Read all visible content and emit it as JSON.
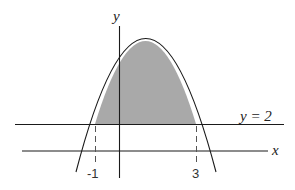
{
  "diagram": {
    "type": "area between curves",
    "curve": "downward parabola",
    "line_label": "y = 2",
    "x_axis_label": "x",
    "y_axis_label": "y",
    "tick_labels": [
      "-1",
      "3"
    ],
    "shaded_region": "between parabola and y = 2 from x = -1 to x = 3",
    "colors": {
      "shade": "#a9a9a9",
      "stroke": "#1a1a1a",
      "background": "#ffffff"
    }
  }
}
